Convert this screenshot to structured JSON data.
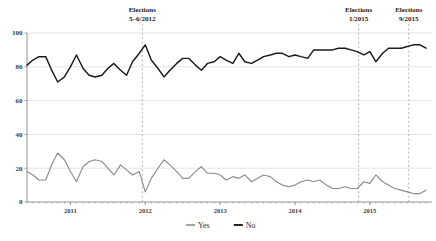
{
  "chart_data": {
    "type": "line",
    "title": "",
    "subtitle": "",
    "xlabel": "",
    "ylabel": "",
    "ylim": [
      0,
      100
    ],
    "yticks": [
      0,
      20,
      40,
      60,
      80,
      100
    ],
    "ytick_labels": [
      "0",
      "20",
      "40",
      "60",
      "80",
      "100"
    ],
    "xtick_labels": [
      "2011",
      "2012",
      "2013",
      "2014",
      "2015"
    ],
    "xtick_x": [
      2011.0,
      2012.0,
      2013.0,
      2014.0,
      2015.0
    ],
    "xlim": [
      2010.42,
      2015.83
    ],
    "grid": "horizontal",
    "legend_position": "bottom-center",
    "series": [
      {
        "name": "Yes",
        "color": "#8c8c8c",
        "x": [
          2010.42,
          2010.5,
          2010.58,
          2010.67,
          2010.75,
          2010.83,
          2010.92,
          2011.0,
          2011.08,
          2011.17,
          2011.25,
          2011.33,
          2011.42,
          2011.5,
          2011.58,
          2011.67,
          2011.75,
          2011.83,
          2011.92,
          2012.0,
          2012.08,
          2012.17,
          2012.25,
          2012.33,
          2012.42,
          2012.5,
          2012.58,
          2012.67,
          2012.75,
          2012.83,
          2012.92,
          2013.0,
          2013.08,
          2013.17,
          2013.25,
          2013.33,
          2013.42,
          2013.5,
          2013.58,
          2013.67,
          2013.75,
          2013.83,
          2013.92,
          2014.0,
          2014.08,
          2014.17,
          2014.25,
          2014.33,
          2014.42,
          2014.5,
          2014.58,
          2014.67,
          2014.75,
          2014.83,
          2014.92,
          2015.0,
          2015.08,
          2015.17,
          2015.25,
          2015.33,
          2015.42,
          2015.5,
          2015.58,
          2015.67,
          2015.75
        ],
        "values": [
          18,
          16,
          13,
          13,
          22,
          29,
          25,
          18,
          12,
          21,
          24,
          25,
          24,
          20,
          16,
          22,
          19,
          16,
          18,
          6,
          14,
          20,
          25,
          22,
          18,
          14,
          14,
          18,
          21,
          17,
          17,
          16,
          13,
          15,
          14,
          16,
          12,
          14,
          16,
          15,
          12,
          10,
          9,
          10,
          12,
          13,
          12,
          13,
          10,
          8,
          8,
          9,
          8,
          8,
          12,
          11,
          16,
          12,
          10,
          8,
          7,
          6,
          5,
          5,
          7
        ]
      },
      {
        "name": "No",
        "color": "#1a1a1a",
        "x": [
          2010.42,
          2010.5,
          2010.58,
          2010.67,
          2010.75,
          2010.83,
          2010.92,
          2011.0,
          2011.08,
          2011.17,
          2011.25,
          2011.33,
          2011.42,
          2011.5,
          2011.58,
          2011.67,
          2011.75,
          2011.83,
          2011.92,
          2012.0,
          2012.08,
          2012.17,
          2012.25,
          2012.33,
          2012.42,
          2012.5,
          2012.58,
          2012.67,
          2012.75,
          2012.83,
          2012.92,
          2013.0,
          2013.08,
          2013.17,
          2013.25,
          2013.33,
          2013.42,
          2013.5,
          2013.58,
          2013.67,
          2013.75,
          2013.83,
          2013.92,
          2014.0,
          2014.08,
          2014.17,
          2014.25,
          2014.33,
          2014.42,
          2014.5,
          2014.58,
          2014.67,
          2014.75,
          2014.83,
          2014.92,
          2015.0,
          2015.08,
          2015.17,
          2015.25,
          2015.33,
          2015.42,
          2015.5,
          2015.58,
          2015.67,
          2015.75
        ],
        "values": [
          81,
          84,
          86,
          86,
          78,
          71,
          74,
          80,
          87,
          79,
          75,
          74,
          75,
          79,
          82,
          78,
          75,
          83,
          88,
          93,
          84,
          79,
          74,
          78,
          82,
          85,
          85,
          81,
          78,
          82,
          83,
          86,
          84,
          82,
          88,
          83,
          82,
          84,
          86,
          87,
          88,
          88,
          86,
          87,
          86,
          85,
          90,
          90,
          90,
          90,
          91,
          91,
          90,
          89,
          87,
          89,
          83,
          88,
          91,
          91,
          91,
          92,
          93,
          93,
          91
        ]
      }
    ],
    "annotations": [
      {
        "id": "elections-2012",
        "line1": "Elections",
        "line2": "5–6/2012",
        "x": 2011.96
      },
      {
        "id": "elections-jan-2015",
        "line1": "Elections",
        "line2": "1/2015",
        "x": 2014.85
      },
      {
        "id": "elections-sep-2015",
        "line1": "Elections",
        "line2": "9/2015",
        "x": 2015.52
      }
    ],
    "legend": [
      {
        "label": "Yes",
        "color": "#8c8c8c"
      },
      {
        "label": "No",
        "color": "#1a1a1a"
      }
    ]
  }
}
